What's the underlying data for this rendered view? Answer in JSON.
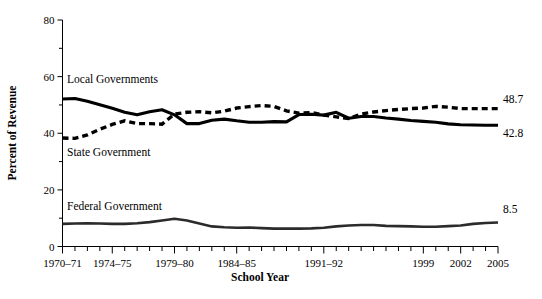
{
  "chart_data": {
    "type": "line",
    "title": "",
    "xlabel": "School Year",
    "ylabel": "Percent of Revenue",
    "ylim": [
      0,
      80
    ],
    "yticks": [
      0,
      20,
      40,
      60,
      80
    ],
    "ytick_labels": [
      "0",
      "20",
      "40",
      "60",
      "80"
    ],
    "yminor_ticks": [
      10,
      30,
      50,
      70
    ],
    "grid": false,
    "legend": "inline-labels",
    "x": [
      "1970-71",
      "1971-72",
      "1972-73",
      "1973-74",
      "1974-75",
      "1975-76",
      "1976-77",
      "1977-78",
      "1978-79",
      "1979-80",
      "1980-81",
      "1981-82",
      "1982-83",
      "1983-84",
      "1984-85",
      "1985-86",
      "1986-87",
      "1987-88",
      "1988-89",
      "1989-90",
      "1990-91",
      "1991-92",
      "1992-93",
      "1993-94",
      "1994-95",
      "1995-96",
      "1996-97",
      "1997-98",
      "1998-99",
      "1999",
      "2000",
      "2001",
      "2002",
      "2003",
      "2004",
      "2005"
    ],
    "xtick_labels_shown": [
      {
        "label": "1970–71",
        "index": 0
      },
      {
        "label": "1974–75",
        "index": 4
      },
      {
        "label": "1979–80",
        "index": 9
      },
      {
        "label": "1984–85",
        "index": 14
      },
      {
        "label": "1991–92",
        "index": 21
      },
      {
        "label": "1999",
        "index": 29
      },
      {
        "label": "2002",
        "index": 32
      },
      {
        "label": "2005",
        "index": 35
      }
    ],
    "series": [
      {
        "name": "Local Governments",
        "style": "solid",
        "label_text": "Local Governments",
        "end_value_label": "42.8",
        "values": [
          52.1,
          52.3,
          51.3,
          50.1,
          48.8,
          47.4,
          46.5,
          47.6,
          48.3,
          46.5,
          43.4,
          43.4,
          44.6,
          45.0,
          44.4,
          43.9,
          43.9,
          44.1,
          44.0,
          46.6,
          46.7,
          46.4,
          47.4,
          45.3,
          45.9,
          45.9,
          45.4,
          45.0,
          44.5,
          44.2,
          43.9,
          43.3,
          43.0,
          42.9,
          42.8,
          42.8
        ]
      },
      {
        "name": "State Government",
        "style": "dashed",
        "label_text": "State Government",
        "end_value_label": "48.7",
        "values": [
          38.3,
          38.2,
          39.4,
          41.4,
          43.1,
          44.4,
          43.4,
          43.4,
          43.2,
          46.8,
          47.4,
          47.6,
          47.2,
          47.8,
          48.9,
          49.4,
          49.8,
          49.5,
          47.9,
          47.1,
          47.3,
          46.4,
          45.8,
          45.2,
          46.8,
          47.5,
          48.0,
          48.4,
          48.7,
          48.9,
          49.5,
          49.2,
          48.7,
          48.7,
          48.7,
          48.7
        ]
      },
      {
        "name": "Federal Government",
        "style": "thin-solid",
        "label_text": "Federal Government",
        "end_value_label": "8.5",
        "values": [
          8.0,
          8.1,
          8.2,
          8.1,
          8.0,
          8.0,
          8.2,
          8.6,
          9.2,
          9.8,
          9.2,
          8.1,
          7.1,
          6.8,
          6.6,
          6.7,
          6.5,
          6.3,
          6.3,
          6.3,
          6.4,
          6.6,
          7.1,
          7.4,
          7.6,
          7.6,
          7.3,
          7.2,
          7.1,
          7.0,
          7.0,
          7.2,
          7.4,
          8.0,
          8.3,
          8.5
        ]
      }
    ]
  },
  "colors": {
    "axis": "#000000",
    "series_line": "#000000",
    "background": "#ffffff"
  }
}
